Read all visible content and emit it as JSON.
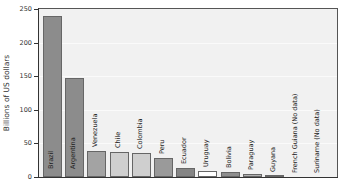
{
  "chart_data": {
    "type": "bar",
    "title": "",
    "xlabel": "",
    "ylabel": "Billions of US dollars",
    "ylim": [
      0,
      250
    ],
    "yticks": [
      0,
      50,
      100,
      150,
      200,
      250
    ],
    "grid": true,
    "legend": null,
    "categories": [
      "Brazil",
      "Argentina",
      "Venezuela",
      "Chile",
      "Colombia",
      "Peru",
      "Ecuador",
      "Uruguay",
      "Bolivia",
      "Paraguay",
      "Guyana",
      "French Guiana (No data)",
      "Suriname (No data)"
    ],
    "values": [
      240,
      147,
      39,
      37,
      35,
      29,
      13,
      9,
      7,
      5,
      2,
      null,
      null
    ],
    "bar_colors": [
      "#8c8c8c",
      "#8c8c8c",
      "#a3a3a3",
      "#cfcfcf",
      "#cfcfcf",
      "#9a9a9a",
      "#858585",
      "#ffffff",
      "#8e8e8e",
      "#b0b0b0",
      "#555555",
      null,
      null
    ]
  },
  "axis": {
    "ylabel": "Billions of US dollars",
    "ticks": [
      "0",
      "50",
      "100",
      "150",
      "200",
      "250"
    ]
  }
}
